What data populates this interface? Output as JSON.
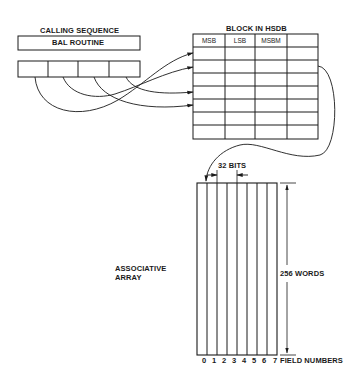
{
  "diagram": {
    "calling_sequence": {
      "title": "CALLING SEQUENCE",
      "routine_label": "BAL ROUTINE",
      "parameter_cells": 4
    },
    "hsdb_block": {
      "title": "BLOCK IN HSDB",
      "columns": [
        "MSB",
        "LSB",
        "MSBM",
        ""
      ],
      "rows": 7
    },
    "associative_array": {
      "label_line1": "ASSOCIATIVE",
      "label_line2": "ARRAY",
      "width_label": "32 BITS",
      "height_label": "256 WORDS",
      "field_numbers": [
        "0",
        "1",
        "2",
        "3",
        "4",
        "5",
        "6",
        "7"
      ],
      "field_numbers_label": "FIELD NUMBERS"
    },
    "colors": {
      "line": "#1a1a1a",
      "background": "#ffffff"
    }
  }
}
